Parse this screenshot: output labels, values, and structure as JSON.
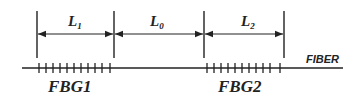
{
  "diagram": {
    "type": "fiber-bragg-grating-layout",
    "segments": [
      {
        "id": "L1",
        "label_main": "L",
        "label_sub": "1",
        "x_start": 37,
        "x_end": 114
      },
      {
        "id": "L0",
        "label_main": "L",
        "label_sub": "0",
        "x_start": 114,
        "x_end": 204
      },
      {
        "id": "L2",
        "label_main": "L",
        "label_sub": "2",
        "x_start": 204,
        "x_end": 284
      }
    ],
    "gratings": [
      {
        "label": "FBG1",
        "x_start": 38,
        "x_end": 111,
        "ticks": 11
      },
      {
        "label": "FBG2",
        "x_start": 206,
        "x_end": 281,
        "ticks": 11
      }
    ],
    "fiber": {
      "label": "FIBER",
      "x_start": 22,
      "x_end": 343
    },
    "colors": {
      "line": "#222222",
      "background": "#ffffff"
    }
  }
}
